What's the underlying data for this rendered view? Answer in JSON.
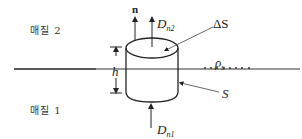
{
  "diagram": {
    "type": "gaussian-pillbox-boundary",
    "colors": {
      "stroke": "#222222",
      "background": "#ffffff"
    },
    "regions": [
      {
        "id": "medium-2",
        "label": "매질 2"
      },
      {
        "id": "medium-1",
        "label": "매질 1"
      }
    ],
    "labels": {
      "normal": "n",
      "d_n2_main": "D",
      "d_n2_sub": "n2",
      "d_n1_main": "D",
      "d_n1_sub": "n1",
      "delta_s": "ΔS",
      "height": "h",
      "rho_main": "ρ",
      "rho_sub": "s",
      "surface": "S"
    }
  }
}
